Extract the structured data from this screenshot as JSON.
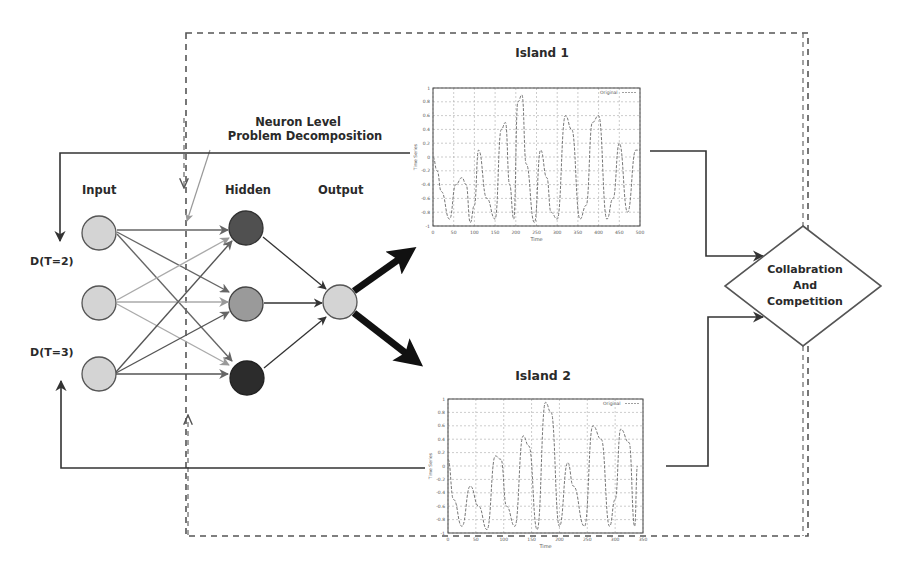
{
  "figure": {
    "labels": {
      "annotation_line1": "Neuron Level",
      "annotation_line2": "Problem Decomposition",
      "input": "Input",
      "hidden": "Hidden",
      "output": "Output",
      "delay_top": "D(T=2)",
      "delay_bottom": "D(T=3)"
    },
    "network": {
      "input_nodes": 3,
      "hidden_nodes": 3,
      "output_nodes": 1,
      "colors": {
        "input": "#d4d4d4",
        "hidden": [
          "#505050",
          "#9a9a9a",
          "#2c2c2c"
        ],
        "output": "#d4d4d4"
      }
    },
    "decision": {
      "line1": "Collabration",
      "line2": "And",
      "line3": "Competition"
    }
  },
  "chart_data": [
    {
      "type": "line",
      "title": "Island 1",
      "legend": [
        "Original"
      ],
      "xlabel": "Time",
      "ylabel": "Time Series",
      "x_ticks": [
        "0",
        "50",
        "100",
        "150",
        "200",
        "250",
        "300",
        "350",
        "400",
        "450",
        "500"
      ],
      "y_ticks": [
        "1",
        "0.8",
        "0.6",
        "0.4",
        "0.2",
        "0",
        "-0.2",
        "-0.4",
        "-0.6",
        "-0.8",
        "-1"
      ],
      "xlim": [
        0,
        500
      ],
      "ylim": [
        -1,
        1
      ],
      "grid": true,
      "series": [
        {
          "name": "Original",
          "x": [
            0,
            10,
            20,
            40,
            55,
            70,
            80,
            90,
            100,
            110,
            130,
            150,
            165,
            175,
            185,
            195,
            205,
            215,
            225,
            245,
            260,
            275,
            285,
            300,
            320,
            335,
            355,
            370,
            385,
            400,
            420,
            435,
            450,
            470,
            490,
            500
          ],
          "values": [
            0,
            -0.2,
            -0.5,
            -0.9,
            -0.4,
            -0.3,
            -0.4,
            -0.95,
            -0.7,
            0.1,
            -0.6,
            -0.9,
            0.4,
            0.5,
            -0.4,
            -0.9,
            0.8,
            0.9,
            -0.1,
            -0.95,
            0.1,
            -0.3,
            -0.8,
            -0.9,
            0.6,
            0.4,
            -0.9,
            -0.7,
            0.5,
            0.6,
            -0.9,
            -0.6,
            0.2,
            -0.8,
            0.1,
            0.1
          ]
        }
      ]
    },
    {
      "type": "line",
      "title": "Island 2",
      "legend": [
        "Original"
      ],
      "xlabel": "Time",
      "ylabel": "Time Series",
      "x_ticks": [
        "0",
        "50",
        "100",
        "150",
        "200",
        "250",
        "300",
        "350"
      ],
      "y_ticks": [
        "1",
        "0.8",
        "0.6",
        "0.4",
        "0.2",
        "0",
        "-0.2",
        "-0.4",
        "-0.6",
        "-0.8",
        "-1"
      ],
      "xlim": [
        0,
        350
      ],
      "ylim": [
        -1,
        1
      ],
      "grid": true,
      "series": [
        {
          "name": "Original",
          "x": [
            0,
            10,
            25,
            40,
            55,
            70,
            85,
            95,
            105,
            120,
            135,
            145,
            160,
            175,
            185,
            200,
            215,
            225,
            245,
            260,
            275,
            290,
            300,
            310,
            325,
            335,
            340
          ],
          "values": [
            0.1,
            -0.5,
            -0.9,
            -0.3,
            -0.6,
            -0.95,
            0.15,
            0.1,
            -0.6,
            -0.9,
            0.45,
            0.3,
            -0.95,
            0.95,
            0.8,
            -0.9,
            0.05,
            -0.3,
            -0.9,
            0.6,
            0.4,
            -0.9,
            -0.5,
            0.55,
            0.35,
            -0.9,
            0.0
          ]
        }
      ]
    }
  ]
}
